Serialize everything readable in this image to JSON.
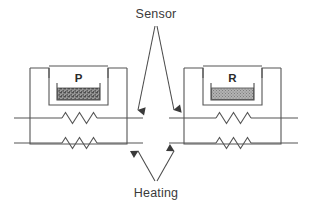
{
  "diagram": {
    "callouts": {
      "sensor": {
        "label": "Sensor",
        "direction": "down",
        "targets": "upper horizontal line"
      },
      "heating": {
        "label": "Heating",
        "direction": "up",
        "targets": "lower horizontal line"
      }
    },
    "cells": [
      {
        "id": "left-cell",
        "label": "P",
        "label_meaning": "sample pan",
        "fill_pattern": "coarse-speckle",
        "fill_color": "#8a8a8a",
        "position": "left"
      },
      {
        "id": "right-cell",
        "label": "R",
        "label_meaning": "reference pan",
        "fill_pattern": "fine-stipple",
        "fill_color": "#a8a8a8",
        "position": "right"
      }
    ],
    "lines": [
      {
        "id": "sensor-line",
        "role": "sensor circuit",
        "y": 118
      },
      {
        "id": "heating-line",
        "role": "heating circuit",
        "y": 143
      }
    ],
    "resistors": [
      {
        "id": "left-sensor-resistor",
        "on_line": "sensor-line",
        "cell": "left-cell"
      },
      {
        "id": "left-heating-resistor",
        "on_line": "heating-line",
        "cell": "left-cell"
      },
      {
        "id": "right-sensor-resistor",
        "on_line": "sensor-line",
        "cell": "right-cell"
      },
      {
        "id": "right-heating-resistor",
        "on_line": "heating-line",
        "cell": "right-cell"
      }
    ],
    "colors": {
      "stroke": "#555555",
      "stroke_dark": "#3a3a3a",
      "text": "#3a3a3a",
      "background": "#ffffff",
      "sample_fill": "#8a8a8a",
      "reference_fill": "#a8a8a8"
    }
  }
}
